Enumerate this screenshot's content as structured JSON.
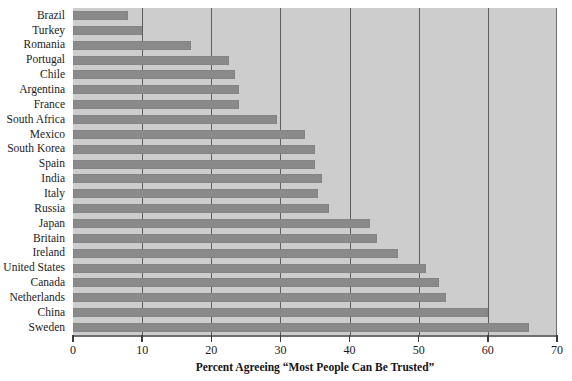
{
  "chart_data": {
    "type": "bar",
    "orientation": "horizontal",
    "title": "",
    "xlabel": "Percent Agreeing “Most People Can Be Trusted”",
    "ylabel": "",
    "xlim": [
      0,
      70
    ],
    "xticks": [
      0,
      10,
      20,
      30,
      40,
      50,
      60,
      70
    ],
    "xtick_labels": [
      "0",
      "10",
      "20",
      "30",
      "40",
      "50",
      "60",
      "70"
    ],
    "grid": true,
    "grid_axis": "x",
    "legend": false,
    "categories": [
      "Brazil",
      "Turkey",
      "Romania",
      "Portugal",
      "Chile",
      "Argentina",
      "France",
      "South Africa",
      "Mexico",
      "South Korea",
      "Spain",
      "India",
      "Italy",
      "Russia",
      "Japan",
      "Britain",
      "Ireland",
      "United States",
      "Canada",
      "Netherlands",
      "China",
      "Sweden"
    ],
    "values": [
      8,
      10,
      17,
      22.5,
      23.5,
      24,
      24,
      29.5,
      33.5,
      35,
      35,
      36,
      35.5,
      37,
      43,
      44,
      47,
      51,
      53,
      54,
      60,
      66
    ],
    "colors": {
      "bar": "#8a8a8a",
      "plot_background": "#cdcdcd",
      "gridline": "#5f5f5f",
      "axis": "#6f6f6f",
      "text": "#1b1b1b",
      "page_background": "#ffffff"
    }
  }
}
